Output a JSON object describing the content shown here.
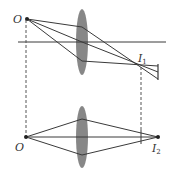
{
  "diagram": {
    "colors": {
      "line": "#3a3a3a",
      "lens_fill": "#7a7a7a",
      "dashed": "#555555",
      "background": "#ffffff"
    },
    "top": {
      "object_label": "O",
      "image_label": "I",
      "image_subscript": "1",
      "object_point": [
        27,
        19
      ],
      "axis_y": 42,
      "axis_x_range": [
        18,
        166
      ],
      "lens": {
        "cx": 82,
        "cy": 42,
        "rx": 6,
        "ry": 33
      },
      "rays": [
        {
          "from": [
            27,
            19
          ],
          "via": [
            82,
            27
          ],
          "to": [
            158,
            79
          ]
        },
        {
          "from": [
            27,
            19
          ],
          "via": [
            82,
            42
          ],
          "to": [
            158,
            72
          ]
        },
        {
          "from": [
            27,
            19
          ],
          "via": [
            82,
            61
          ],
          "to": [
            158,
            66
          ]
        }
      ],
      "image_point": [
        140,
        66
      ],
      "screen_line": {
        "x": 158,
        "y_range": [
          64,
          80
        ]
      },
      "object_label_pos": [
        13,
        23
      ],
      "image_label_pos": [
        138,
        62
      ]
    },
    "bottom": {
      "object_label": "O",
      "image_label": "I",
      "image_subscript": "2",
      "object_point": [
        26,
        137
      ],
      "axis_y": 137,
      "axis_x_range": [
        26,
        158
      ],
      "lens": {
        "cx": 82,
        "cy": 137,
        "rx": 6,
        "ry": 31
      },
      "rays": [
        {
          "from": [
            26,
            137
          ],
          "via": [
            82,
            119
          ],
          "to": [
            158,
            137
          ]
        },
        {
          "from": [
            26,
            137
          ],
          "via": [
            82,
            155
          ],
          "to": [
            158,
            137
          ]
        }
      ],
      "image_point": [
        158,
        137
      ],
      "tick_line": {
        "x": 141,
        "y_range": [
          130,
          144
        ]
      },
      "object_label_pos": [
        15,
        151
      ],
      "image_label_pos": [
        152,
        152
      ]
    },
    "dashed_lines": [
      {
        "x": 26,
        "y_range": [
          20,
          136
        ]
      },
      {
        "x": 141,
        "y_range": [
          66,
          130
        ]
      }
    ]
  }
}
